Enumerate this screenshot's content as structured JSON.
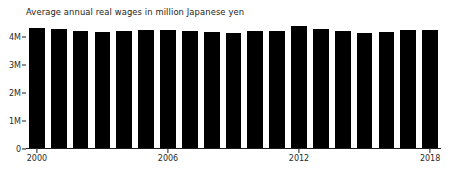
{
  "chart_data": {
    "type": "bar",
    "title": "Average annual real wages in million Japanese yen",
    "xlabel": "",
    "ylabel": "",
    "categories": [
      "2000",
      "2001",
      "2002",
      "2003",
      "2004",
      "2005",
      "2006",
      "2007",
      "2008",
      "2009",
      "2010",
      "2011",
      "2012",
      "2013",
      "2014",
      "2015",
      "2016",
      "2017",
      "2018"
    ],
    "values": [
      4.3,
      4.29,
      4.22,
      4.18,
      4.21,
      4.23,
      4.24,
      4.21,
      4.19,
      4.12,
      4.22,
      4.22,
      4.37,
      4.27,
      4.22,
      4.15,
      4.16,
      4.24,
      4.24
    ],
    "ylim": [
      0,
      4.6
    ],
    "yticks": [
      0,
      1,
      2,
      3,
      4
    ],
    "ytick_labels": [
      "0",
      "1M",
      "2M",
      "3M",
      "4M"
    ],
    "xticks": [
      "2000",
      "2006",
      "2012",
      "2018"
    ],
    "grid": false,
    "legend": null,
    "bar_color": "#000000",
    "axis_color": "#1b1b1b",
    "text_color": "#2a2a2a",
    "background": "#ffffff"
  }
}
